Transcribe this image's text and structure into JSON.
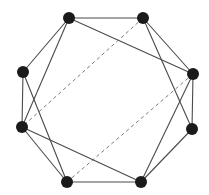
{
  "diagram": {
    "type": "graph",
    "width": 209,
    "height": 195,
    "colors": {
      "background": "#ffffff",
      "node": "#1a1a1a",
      "solid_edge": "#4a4a4a",
      "dashed_edge": "#7a7a7a"
    },
    "node_radius": 6,
    "nodes": [
      {
        "id": "A",
        "x": 69,
        "y": 18
      },
      {
        "id": "B",
        "x": 143,
        "y": 18
      },
      {
        "id": "C",
        "x": 193,
        "y": 74
      },
      {
        "id": "D",
        "x": 192,
        "y": 129
      },
      {
        "id": "E",
        "x": 141,
        "y": 182
      },
      {
        "id": "F",
        "x": 67,
        "y": 182
      },
      {
        "id": "G",
        "x": 22,
        "y": 127
      },
      {
        "id": "H",
        "x": 23,
        "y": 72
      }
    ],
    "edges": [
      {
        "from": "A",
        "to": "B",
        "style": "solid"
      },
      {
        "from": "A",
        "to": "H",
        "style": "solid"
      },
      {
        "from": "A",
        "to": "G",
        "style": "solid"
      },
      {
        "from": "A",
        "to": "C",
        "style": "solid"
      },
      {
        "from": "B",
        "to": "C",
        "style": "solid"
      },
      {
        "from": "B",
        "to": "D",
        "style": "solid"
      },
      {
        "from": "B",
        "to": "G",
        "style": "dashed"
      },
      {
        "from": "C",
        "to": "D",
        "style": "solid"
      },
      {
        "from": "C",
        "to": "E",
        "style": "solid"
      },
      {
        "from": "C",
        "to": "F",
        "style": "dashed"
      },
      {
        "from": "D",
        "to": "E",
        "style": "solid"
      },
      {
        "from": "E",
        "to": "F",
        "style": "solid"
      },
      {
        "from": "E",
        "to": "G",
        "style": "solid"
      },
      {
        "from": "F",
        "to": "H",
        "style": "solid"
      },
      {
        "from": "F",
        "to": "G",
        "style": "solid"
      },
      {
        "from": "G",
        "to": "H",
        "style": "solid"
      }
    ]
  }
}
